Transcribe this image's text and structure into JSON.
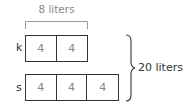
{
  "diagram": {
    "top_bracket_label": "8 liters",
    "total_label": "20 liters",
    "rows": [
      {
        "label": "k",
        "cells": [
          "4",
          "4"
        ]
      },
      {
        "label": "s",
        "cells": [
          "4",
          "4",
          "4"
        ]
      }
    ]
  }
}
